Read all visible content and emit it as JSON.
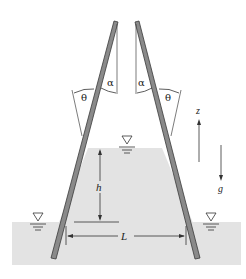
{
  "diagram": {
    "labels": {
      "alpha_left": "α",
      "alpha_right": "α",
      "theta_left": "θ",
      "theta_right": "θ",
      "height": "h",
      "separation": "L",
      "vertical_axis": "z",
      "gravity": "g"
    },
    "colors": {
      "liquid": "#e3e3e3",
      "plate_fill": "#8a8a8a",
      "plate_edge": "#3a3a3a",
      "line": "#2a2a2a",
      "background": "#ffffff"
    },
    "symbols": {
      "free_surface_marker": "▽"
    }
  }
}
